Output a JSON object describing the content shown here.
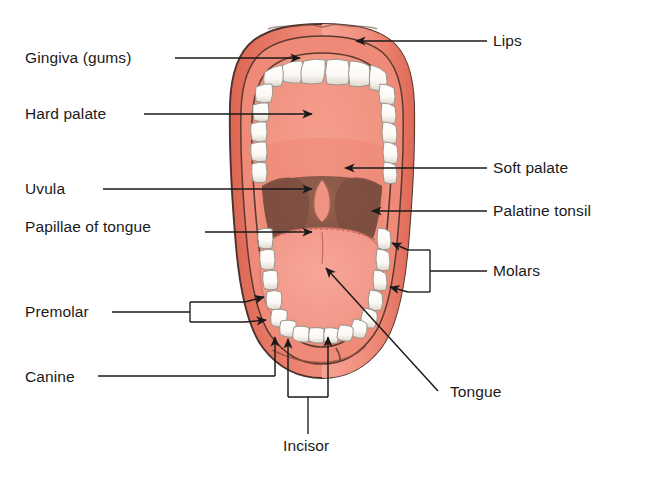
{
  "diagram": {
    "colors": {
      "lip_outer": "#e8705e",
      "lip_inner": "#ef8a78",
      "hard_palate": "#f0917f",
      "soft_palate": "#ee8a78",
      "tongue": "#f2998a",
      "tongue_edge": "#e98877",
      "throat_dark": "#8b5a4a",
      "tonsil": "#7d4e40",
      "tooth": "#fdfdfb",
      "tooth_shade": "#e3ded6",
      "outline": "#3b2b26",
      "leader": "#1a1a1a",
      "background": "#ffffff"
    },
    "labels": {
      "lips": "Lips",
      "gingiva": "Gingiva (gums)",
      "hard_palate": "Hard palate",
      "soft_palate": "Soft palate",
      "uvula": "Uvula",
      "palatine_tonsil": "Palatine tonsil",
      "papillae": "Papillae of tongue",
      "molars": "Molars",
      "premolar": "Premolar",
      "tongue": "Tongue",
      "canine": "Canine",
      "incisor": "Incisor"
    },
    "label_list": [
      {
        "id": "lips",
        "text": "Lips",
        "side": "right",
        "x": 493,
        "y": 46,
        "pointer": "arrow"
      },
      {
        "id": "gingiva",
        "text": "Gingiva (gums)",
        "side": "left",
        "x": 25,
        "y": 62,
        "pointer": "arrow"
      },
      {
        "id": "hard-palate",
        "text": "Hard palate",
        "side": "left",
        "x": 25,
        "y": 117,
        "pointer": "arrow"
      },
      {
        "id": "soft-palate",
        "text": "Soft palate",
        "side": "right",
        "x": 493,
        "y": 172,
        "pointer": "arrow"
      },
      {
        "id": "uvula",
        "text": "Uvula",
        "side": "left",
        "x": 25,
        "y": 192,
        "pointer": "arrow"
      },
      {
        "id": "palatine-tonsil",
        "text": "Palatine tonsil",
        "side": "right",
        "x": 493,
        "y": 214,
        "pointer": "arrow"
      },
      {
        "id": "papillae",
        "text": "Papillae of tongue",
        "side": "left",
        "x": 25,
        "y": 230,
        "pointer": "arrow"
      },
      {
        "id": "molars",
        "text": "Molars",
        "side": "right",
        "x": 493,
        "y": 272,
        "pointer": "bracket"
      },
      {
        "id": "premolar",
        "text": "Premolar",
        "side": "left",
        "x": 25,
        "y": 312,
        "pointer": "bracket"
      },
      {
        "id": "tongue",
        "text": "Tongue",
        "side": "right",
        "x": 450,
        "y": 393,
        "pointer": "arrow"
      },
      {
        "id": "canine",
        "text": "Canine",
        "side": "left",
        "x": 25,
        "y": 379,
        "pointer": "arrow"
      },
      {
        "id": "incisor",
        "text": "Incisor",
        "side": "bottom",
        "x": 283,
        "y": 450,
        "pointer": "bracket"
      }
    ],
    "structures": [
      {
        "id": "upper-teeth-arch",
        "name": "upper teeth arch",
        "count": 16
      },
      {
        "id": "lower-teeth-arch",
        "name": "lower teeth arch",
        "count": 16
      },
      {
        "id": "uvula-shape",
        "name": "uvula"
      },
      {
        "id": "tonsil-left",
        "name": "left palatine tonsil"
      },
      {
        "id": "tonsil-right",
        "name": "right palatine tonsil"
      },
      {
        "id": "tongue-body",
        "name": "tongue body"
      }
    ]
  }
}
